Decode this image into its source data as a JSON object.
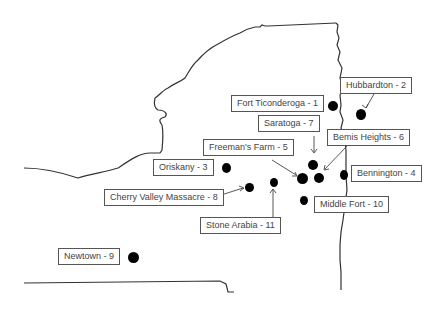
{
  "map": {
    "subject": "Revolutionary War battle sites in New York state region",
    "outline_color": "#333333",
    "marker_color": "#000000",
    "battles": [
      {
        "id": 1,
        "label": "Fort Ticonderoga - 1"
      },
      {
        "id": 2,
        "label": "Hubbardton - 2"
      },
      {
        "id": 3,
        "label": "Oriskany - 3"
      },
      {
        "id": 4,
        "label": "Bennington - 4"
      },
      {
        "id": 5,
        "label": "Freeman's Farm - 5"
      },
      {
        "id": 6,
        "label": "Bemis Heights - 6"
      },
      {
        "id": 7,
        "label": "Saratoga - 7"
      },
      {
        "id": 8,
        "label": "Cherry Valley Massacre - 8"
      },
      {
        "id": 9,
        "label": "Newtown - 9"
      },
      {
        "id": 10,
        "label": "Middle Fort - 10"
      },
      {
        "id": 11,
        "label": "Stone Arabia - 11"
      }
    ]
  }
}
